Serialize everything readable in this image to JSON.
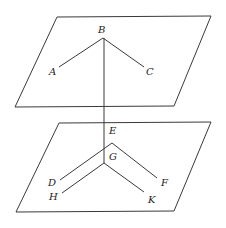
{
  "diagram": {
    "type": "geometry-parallel-planes",
    "stroke_color": "#3a3a3a",
    "planes": [
      {
        "id": "upper-plane",
        "points": [
          [
            57,
            17
          ],
          [
            211,
            16
          ],
          [
            174,
            106
          ],
          [
            15,
            107
          ]
        ]
      },
      {
        "id": "lower-plane",
        "points": [
          [
            59,
            123
          ],
          [
            211,
            122
          ],
          [
            174,
            211
          ],
          [
            16,
            212
          ]
        ]
      }
    ],
    "segments": [
      {
        "id": "BA",
        "from": [
          103,
          38
        ],
        "to": [
          59,
          67
        ]
      },
      {
        "id": "BC",
        "from": [
          103,
          38
        ],
        "to": [
          144,
          67
        ]
      },
      {
        "id": "BG",
        "from": [
          104,
          38
        ],
        "to": [
          104,
          163
        ]
      },
      {
        "id": "ED",
        "from": [
          112,
          143
        ],
        "to": [
          60,
          180
        ]
      },
      {
        "id": "EF",
        "from": [
          112,
          143
        ],
        "to": [
          157,
          178
        ]
      },
      {
        "id": "GH",
        "from": [
          104,
          163
        ],
        "to": [
          62,
          193
        ]
      },
      {
        "id": "GK",
        "from": [
          104,
          163
        ],
        "to": [
          144,
          192
        ]
      }
    ],
    "labels": [
      {
        "text": "B",
        "x": 98,
        "y": 33
      },
      {
        "text": "A",
        "x": 49,
        "y": 75
      },
      {
        "text": "C",
        "x": 146,
        "y": 75
      },
      {
        "text": "E",
        "x": 109,
        "y": 134
      },
      {
        "text": "G",
        "x": 109,
        "y": 160
      },
      {
        "text": "D",
        "x": 48,
        "y": 186
      },
      {
        "text": "F",
        "x": 161,
        "y": 186
      },
      {
        "text": "H",
        "x": 49,
        "y": 200
      },
      {
        "text": "K",
        "x": 148,
        "y": 203
      }
    ]
  }
}
